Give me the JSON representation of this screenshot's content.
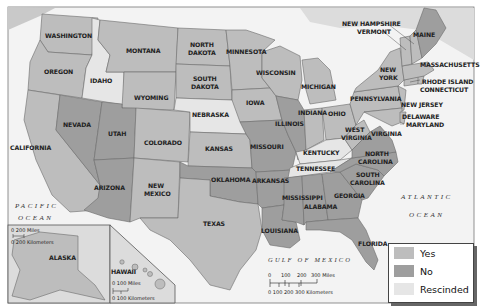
{
  "colors": {
    "yes": "#bdbdbd",
    "no": "#9e9e9e",
    "rescinded": "#e6e6e6",
    "water": "#f3f3f3",
    "foreign": "#c9c9c9",
    "border": "#6b6b6b"
  },
  "oceans": {
    "pacific_line1": "PACIFIC",
    "pacific_line2": "OCEAN",
    "atlantic_line1": "ATLANTIC",
    "atlantic_line2": "OCEAN",
    "gulf": "GULF OF MEXICO"
  },
  "states": {
    "washington": "WASHINGTON",
    "oregon": "OREGON",
    "california": "CALIFORNIA",
    "idaho": "IDAHO",
    "nevada": "NEVADA",
    "montana": "MONTANA",
    "wyoming": "WYOMING",
    "utah": "UTAH",
    "colorado": "COLORADO",
    "arizona": "ARIZONA",
    "new_mexico_1": "NEW",
    "new_mexico_2": "MEXICO",
    "north_dakota_1": "NORTH",
    "north_dakota_2": "DAKOTA",
    "south_dakota_1": "SOUTH",
    "south_dakota_2": "DAKOTA",
    "nebraska": "NEBRASKA",
    "kansas": "KANSAS",
    "oklahoma": "OKLAHOMA",
    "texas": "TEXAS",
    "minnesota": "MINNESOTA",
    "iowa": "IOWA",
    "missouri": "MISSOURI",
    "arkansas": "ARKANSAS",
    "louisiana": "LOUISIANA",
    "wisconsin": "WISCONSIN",
    "illinois": "ILLINOIS",
    "michigan": "MICHIGAN",
    "indiana": "INDIANA",
    "ohio": "OHIO",
    "kentucky": "KENTUCKY",
    "tennessee": "TENNESSEE",
    "mississippi": "MISSISSIPPI",
    "alabama": "ALABAMA",
    "georgia": "GEORGIA",
    "florida": "FLORIDA",
    "south_carolina_1": "SOUTH",
    "south_carolina_2": "CAROLINA",
    "north_carolina_1": "NORTH",
    "north_carolina_2": "CAROLINA",
    "virginia": "VIRGINIA",
    "west_virginia_1": "WEST",
    "west_virginia_2": "VIRGINIA",
    "pennsylvania": "PENNSYLVANIA",
    "new_york_1": "NEW",
    "new_york_2": "YORK",
    "new_jersey": "NEW JERSEY",
    "delaware": "DELAWARE",
    "maryland": "MARYLAND",
    "connecticut": "CONNECTICUT",
    "rhode_island": "RHODE ISLAND",
    "massachusetts": "MASSACHUSETTS",
    "vermont": "VERMONT",
    "new_hampshire": "NEW HAMPSHIRE",
    "maine": "MAINE",
    "alaska": "ALASKA",
    "hawaii": "HAWAII"
  },
  "scale_main": {
    "miles_ticks": [
      "0",
      "100",
      "200",
      "300 Miles"
    ],
    "km_label": "0  100 200 300 Kilometers"
  },
  "scale_alaska": {
    "miles": "0   200 Miles",
    "km": "0 200 Kilometers"
  },
  "scale_hawaii": {
    "miles": "0    100 Miles",
    "km": "0   100 Kilometers"
  },
  "legend": {
    "items": [
      {
        "label": "Yes",
        "color": "#bdbdbd"
      },
      {
        "label": "No",
        "color": "#9e9e9e"
      },
      {
        "label": "Rescinded",
        "color": "#e6e6e6"
      }
    ]
  }
}
